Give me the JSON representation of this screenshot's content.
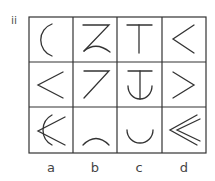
{
  "figure": {
    "section_label": "ii",
    "columns": [
      "a",
      "b",
      "c",
      "d"
    ],
    "grid": {
      "rows": 3,
      "cols": 4,
      "cells": [
        [
          "left-arc",
          "z-with-arc",
          "t-shape",
          "less-than"
        ],
        [
          "less-than",
          "seven-shape",
          "anchor-shape",
          "greater-than"
        ],
        [
          "arc-with-less-than",
          "cap-arc",
          "cup-arc",
          "double-less-than"
        ]
      ]
    },
    "stroke_color": "#333333"
  }
}
